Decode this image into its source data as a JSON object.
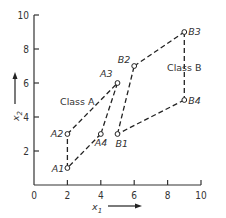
{
  "chart_data": {
    "type": "scatter",
    "title": "",
    "xlabel": "x1",
    "ylabel": "x2",
    "xlim": [
      0,
      10
    ],
    "ylim": [
      0,
      10
    ],
    "x_ticks": [
      "0",
      "2",
      "4",
      "6",
      "8",
      "10"
    ],
    "y_ticks": [
      "2",
      "4",
      "6",
      "8",
      "10"
    ],
    "grid": false,
    "series": [
      {
        "name": "Class A",
        "label": "Class A",
        "points": [
          {
            "id": "A1",
            "x": 2,
            "y": 1
          },
          {
            "id": "A2",
            "x": 2,
            "y": 3
          },
          {
            "id": "A3",
            "x": 5,
            "y": 6
          },
          {
            "id": "A4",
            "x": 4,
            "y": 3
          }
        ]
      },
      {
        "name": "Class B",
        "label": "Class B",
        "points": [
          {
            "id": "B1",
            "x": 5,
            "y": 3
          },
          {
            "id": "B2",
            "x": 6,
            "y": 7
          },
          {
            "id": "B3",
            "x": 9,
            "y": 9
          },
          {
            "id": "B4",
            "x": 9,
            "y": 5
          }
        ]
      }
    ],
    "edges": [
      [
        "A1",
        "A2"
      ],
      [
        "A2",
        "A3"
      ],
      [
        "A3",
        "A4"
      ],
      [
        "A4",
        "A1"
      ],
      [
        "B1",
        "B2"
      ],
      [
        "B2",
        "B3"
      ],
      [
        "B3",
        "B4"
      ],
      [
        "B4",
        "B1"
      ]
    ]
  },
  "labels": {
    "x_axis": "x",
    "x_axis_sub": "1",
    "y_axis": "x",
    "y_axis_sub": "2",
    "class_a": "Class A",
    "class_b": "Class B"
  }
}
